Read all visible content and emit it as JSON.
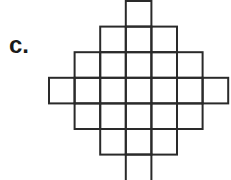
{
  "label": "c.",
  "figure": {
    "grid_origin_x": 49,
    "grid_origin_y": 1,
    "cell_size": 25.6,
    "rows": [
      {
        "row": 0,
        "start_col": 3,
        "end_col": 3
      },
      {
        "row": 1,
        "start_col": 2,
        "end_col": 4
      },
      {
        "row": 2,
        "start_col": 1,
        "end_col": 5
      },
      {
        "row": 3,
        "start_col": 0,
        "end_col": 6
      },
      {
        "row": 4,
        "start_col": 1,
        "end_col": 5
      },
      {
        "row": 5,
        "start_col": 2,
        "end_col": 4
      },
      {
        "row": 6,
        "start_col": 3,
        "end_col": 3,
        "open_bottom": true
      }
    ],
    "stroke_color": "#2a2a2a",
    "stroke_width": 2
  }
}
